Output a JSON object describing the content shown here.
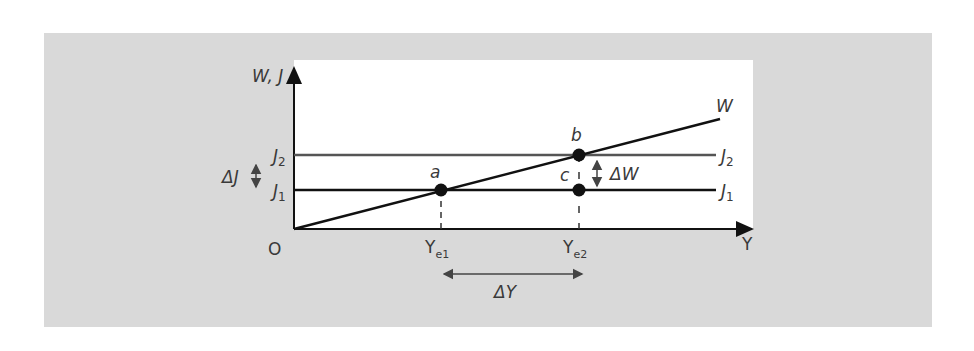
{
  "diagram": {
    "y_axis_label": "W, J",
    "x_axis_label": "Y",
    "origin_label": "O",
    "lines": {
      "w_label": "W",
      "j2_label": "J",
      "j2_sub": "2",
      "j1_label": "J",
      "j1_sub": "1"
    },
    "y_ticks": {
      "j2_label": "J",
      "j2_sub": "2",
      "j1_label": "J",
      "j1_sub": "1"
    },
    "points": {
      "a": "a",
      "b": "b",
      "c": "c"
    },
    "x_ticks": {
      "ye1_label": "Y",
      "ye1_sub": "e1",
      "ye2_label": "Y",
      "ye2_sub": "e2"
    },
    "deltas": {
      "delta_j": "ΔJ",
      "delta_w": "ΔW",
      "delta_y": "ΔY"
    },
    "colors": {
      "panel": "#d9d9d9",
      "plot_bg": "#ffffff",
      "line": "#111111",
      "j2_line": "#555555",
      "text": "#3a3a3a"
    }
  }
}
